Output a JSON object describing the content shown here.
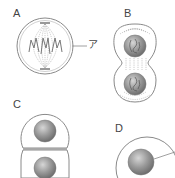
{
  "diagram": {
    "type": "cell-division-stages",
    "panels": [
      {
        "id": "A",
        "label": "A",
        "pointer_label": "ア",
        "description": "cell with chromosomes aligned on spindle fibers"
      },
      {
        "id": "B",
        "label": "B",
        "description": "dividing cell with two daughter nuclei and spindle fibers"
      },
      {
        "id": "C",
        "label": "C",
        "description": "two daughter cells separated, each with nucleus"
      },
      {
        "id": "D",
        "label": "D",
        "description": "single cell with nucleus and pointer line"
      }
    ],
    "colors": {
      "outline": "#8a8a8a",
      "nucleus": "#8c8c8c",
      "nucleus_highlight": "#d0d0d0",
      "text": "#444444"
    }
  }
}
